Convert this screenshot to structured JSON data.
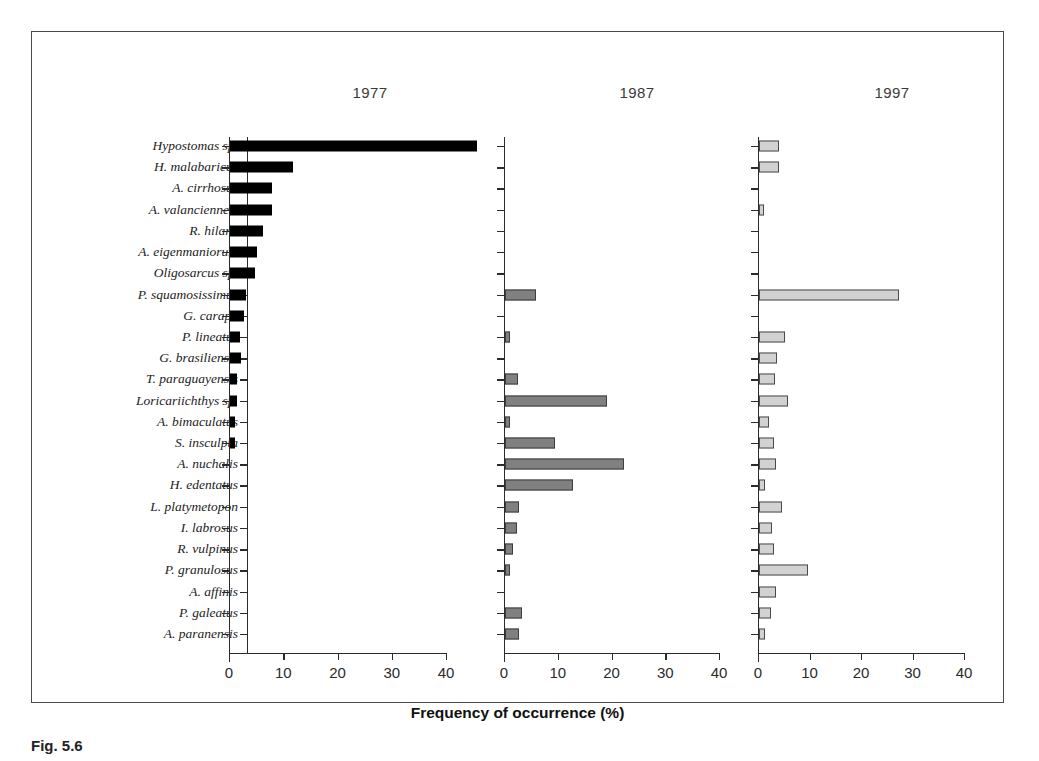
{
  "figure": {
    "caption_partial": "Fig. 5.6",
    "axis_title": "Frequency of occurrence (%)"
  },
  "panels": [
    {
      "title": "1977"
    },
    {
      "title": "1987"
    },
    {
      "title": "1997"
    }
  ],
  "axis": {
    "ticks": [
      "0",
      "10",
      "20",
      "30",
      "40"
    ],
    "tick_values": [
      0,
      10,
      20,
      30,
      40
    ],
    "min": 0,
    "max": 40
  },
  "colors": {
    "bar_1977": "#000000",
    "bar_1987": "#808080",
    "bar_1997": "#d2d2d2",
    "axis": "#2b2b2b",
    "frame": "#4a4a4a"
  },
  "chart_data": {
    "type": "bar",
    "title": "",
    "xlabel": "Frequency of occurrence (%)",
    "ylabel": "",
    "xlim": [
      0,
      40
    ],
    "grid": false,
    "legend_position": "none",
    "orientation": "horizontal",
    "panels": [
      "1977",
      "1987",
      "1997"
    ],
    "categories": [
      "Hypostomas sp.",
      "H. malabaricus",
      "A. cirrhosus",
      "A. valanciennesi",
      "R. hilarii",
      "A. eigenmaniorum",
      "Oligosarcus sp.",
      "P. squamosissimus",
      "G. carapo",
      "P. lineatus",
      "G. brasiliensis",
      "T. paraguayensis",
      "Loricariichthys sp.",
      "A. bimaculatus",
      "S. insculpta",
      "A. nuchalis",
      "H. edentatus",
      "L. platymetopon",
      "I. labrosus",
      "R. vulpinus",
      "P. granulosus",
      "A. affinis",
      "P. galeatus",
      "A. paranensis"
    ],
    "series": [
      {
        "name": "1977",
        "values": [
          45.5,
          11.7,
          7.8,
          7.7,
          6.0,
          5.0,
          4.6,
          3.0,
          2.6,
          1.9,
          2.0,
          1.3,
          1.2,
          1.0,
          0.9,
          0,
          0,
          0,
          0,
          0,
          0,
          0,
          0,
          0
        ]
      },
      {
        "name": "1987",
        "values": [
          0,
          0,
          0,
          0,
          0,
          0,
          0,
          5.7,
          0,
          0.9,
          0,
          2.4,
          18.9,
          1.0,
          9.3,
          22.2,
          12.6,
          2.6,
          2.2,
          1.4,
          0.9,
          0,
          3.2,
          2.6
        ]
      },
      {
        "name": "1997",
        "values": [
          3.9,
          3.9,
          0,
          1.0,
          0,
          0,
          0,
          27.2,
          0,
          5.0,
          3.5,
          3.2,
          5.6,
          2.0,
          3.0,
          3.3,
          1.2,
          4.5,
          2.6,
          3.0,
          9.6,
          3.3,
          2.3,
          1.2
        ]
      }
    ]
  }
}
